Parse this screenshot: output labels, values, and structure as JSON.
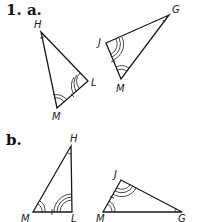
{
  "problem": {
    "number_label": "1. a.",
    "part_b_label": "b."
  },
  "part_a": {
    "triangle_1": {
      "vertices": {
        "H": "H",
        "L": "L",
        "M": "M"
      }
    },
    "triangle_2": {
      "vertices": {
        "J": "J",
        "G": "G",
        "M": "M"
      }
    }
  },
  "part_b": {
    "triangle_1": {
      "vertices": {
        "H": "H",
        "M": "M",
        "L": "L"
      }
    },
    "triangle_2": {
      "vertices": {
        "J": "J",
        "M": "M",
        "G": "G"
      }
    }
  },
  "colors": {
    "stroke": "#1a1a1a",
    "background": "#ffffff"
  }
}
